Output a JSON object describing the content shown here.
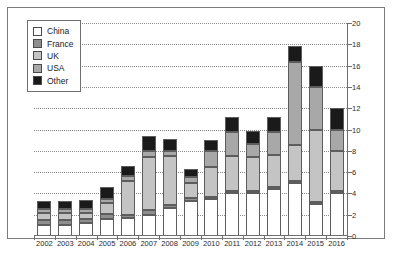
{
  "chart_data": {
    "type": "bar",
    "stacked": true,
    "title": "",
    "subtitle": "",
    "xlabel": "",
    "ylabel": "",
    "ylim": [
      0,
      20
    ],
    "ytick_step": 2,
    "yticks": [
      0,
      2,
      4,
      6,
      8,
      10,
      12,
      14,
      16,
      18,
      20
    ],
    "grid": true,
    "grid_style": "dotted-horizontal",
    "y_axis_position": "right",
    "legend_position": "top-left",
    "categories": [
      "2002",
      "2003",
      "2004",
      "2005",
      "2006",
      "2007",
      "2008",
      "2009",
      "2010",
      "2011",
      "2012",
      "2013",
      "2014",
      "2015",
      "2016"
    ],
    "series": [
      {
        "name": "China",
        "color": "#ffffff",
        "values": [
          1.0,
          1.0,
          1.2,
          1.6,
          1.7,
          2.0,
          2.6,
          3.3,
          3.5,
          4.0,
          4.0,
          4.4,
          5.0,
          3.0,
          4.0
        ]
      },
      {
        "name": "France",
        "color": "#8e8e8e",
        "values": [
          0.5,
          0.5,
          0.4,
          0.5,
          0.3,
          0.4,
          0.3,
          0.3,
          0.2,
          0.2,
          0.2,
          0.2,
          0.2,
          0.2,
          0.2
        ]
      },
      {
        "name": "UK",
        "color": "#c4c4c4",
        "values": [
          0.7,
          0.7,
          0.6,
          1.0,
          3.2,
          5.0,
          4.6,
          1.4,
          2.8,
          3.3,
          3.2,
          3.0,
          3.3,
          6.8,
          3.8
        ]
      },
      {
        "name": "USA",
        "color": "#a8a8a8",
        "values": [
          0.3,
          0.3,
          0.3,
          0.4,
          0.4,
          0.6,
          0.5,
          0.5,
          1.5,
          2.3,
          1.2,
          2.2,
          7.8,
          4.0,
          2.0
        ]
      },
      {
        "name": "Other",
        "color": "#1a1a1a",
        "values": [
          0.8,
          0.8,
          0.9,
          1.1,
          1.0,
          1.4,
          1.1,
          0.8,
          1.0,
          1.4,
          1.3,
          1.4,
          1.5,
          2.0,
          2.0
        ]
      }
    ],
    "totals": [
      3.3,
      3.3,
      3.4,
      4.6,
      6.6,
      9.4,
      9.1,
      6.3,
      9.0,
      11.2,
      9.9,
      11.2,
      17.8,
      16.0,
      12.0
    ]
  },
  "legend": {
    "items": [
      {
        "label": "China"
      },
      {
        "label": "France"
      },
      {
        "label": "UK"
      },
      {
        "label": "USA"
      },
      {
        "label": "Other"
      }
    ]
  }
}
